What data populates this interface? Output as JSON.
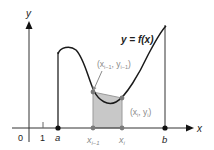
{
  "diagram": {
    "axes": {
      "x_label": "x",
      "y_label": "y",
      "origin_label": "0",
      "tick_label": "1"
    },
    "curve_label": "y = f(x)",
    "points": {
      "a_label": "a",
      "b_label": "b",
      "x_prev_label": "x",
      "x_prev_sub": "i−1",
      "x_i_label": "x",
      "x_i_sub": "i"
    },
    "annotations": {
      "prev_point": "(x",
      "prev_point_sub": "i−1",
      "prev_point_mid": ", y",
      "prev_point_sub2": "i−1",
      "prev_point_end": ")",
      "cur_point": "(x",
      "cur_point_sub": "i",
      "cur_point_mid": ", y",
      "cur_point_sub2": "i",
      "cur_point_end": ")"
    },
    "colors": {
      "axis": "#333333",
      "curve": "#1a1a1a",
      "shade": "#c8c8c8",
      "shade_edge": "#8a8a8a",
      "point_grey": "#7a7a7a"
    }
  }
}
